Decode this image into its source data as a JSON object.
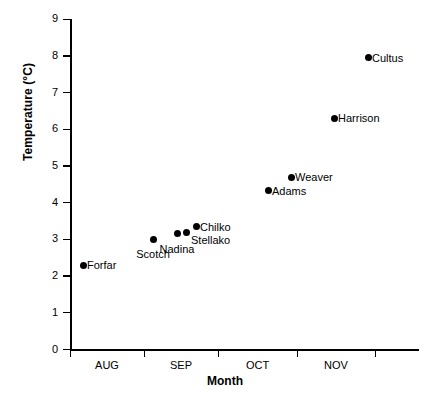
{
  "chart_data": {
    "type": "scatter",
    "title": "",
    "xlabel": "Month",
    "ylabel": "Temperature (°C)",
    "ylim": [
      0,
      9
    ],
    "yticks": [
      0,
      1,
      2,
      3,
      4,
      5,
      6,
      7,
      8,
      9
    ],
    "ytick_labels": [
      "0",
      "1",
      "2",
      "3",
      "4",
      "5",
      "6",
      "7",
      "8",
      "9"
    ],
    "xtick_labels": [
      "AUG",
      "SEP",
      "OCT",
      "NOV"
    ],
    "grid": false,
    "legend": "none",
    "points": [
      {
        "label": "Forfar",
        "x_px": 83,
        "y": 2.3,
        "label_pos": "right"
      },
      {
        "label": "Scotch",
        "x_px": 153,
        "y": 3.0,
        "label_pos": "below"
      },
      {
        "label": "Nadina",
        "x_px": 177,
        "y": 3.15,
        "label_pos": "below"
      },
      {
        "label": "Stellako",
        "x_px": 186,
        "y": 3.2,
        "label_pos": "below-right"
      },
      {
        "label": "Chilko",
        "x_px": 196,
        "y": 3.35,
        "label_pos": "right"
      },
      {
        "label": "Adams",
        "x_px": 268,
        "y": 4.33,
        "label_pos": "right"
      },
      {
        "label": "Weaver",
        "x_px": 291,
        "y": 4.7,
        "label_pos": "right"
      },
      {
        "label": "Harrison",
        "x_px": 334,
        "y": 6.3,
        "label_pos": "right"
      },
      {
        "label": "Cultus",
        "x_px": 368,
        "y": 7.95,
        "label_pos": "right"
      }
    ]
  }
}
